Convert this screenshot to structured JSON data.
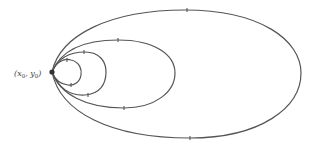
{
  "diagram": {
    "point_label": {
      "x": "x",
      "x_sub": "0",
      "y": "y",
      "y_sub": "0"
    },
    "point": {
      "cx": 52,
      "cy": 72
    },
    "curves": [
      {
        "name": "orbit-1",
        "right_extent": 81
      },
      {
        "name": "orbit-2",
        "right_extent": 106
      },
      {
        "name": "orbit-3",
        "right_extent": 175
      },
      {
        "name": "orbit-4",
        "right_extent": 301
      }
    ],
    "colors": {
      "stroke": "#555555",
      "point": "#333333",
      "background": "#ffffff"
    }
  }
}
